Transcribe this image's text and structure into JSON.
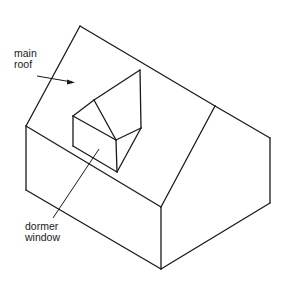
{
  "diagram": {
    "type": "isometric-line-drawing",
    "labels": {
      "main_roof": {
        "line1": "main",
        "line2": "roof"
      },
      "dormer_window": {
        "line1": "dormer",
        "line2": "window"
      }
    },
    "colors": {
      "line": "#1a1a1a",
      "background": "#ffffff"
    }
  }
}
